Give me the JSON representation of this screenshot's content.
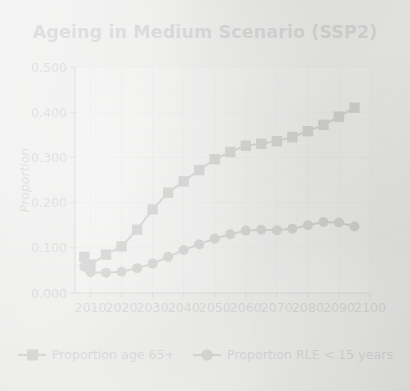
{
  "chart_data": {
    "type": "line",
    "title": "Ageing in Medium Scenario (SSP2)",
    "xlabel": "",
    "ylabel": "Proportion",
    "xlim": [
      2005,
      2100
    ],
    "ylim": [
      0.0,
      0.5
    ],
    "xticks": [
      2010,
      2020,
      2030,
      2040,
      2050,
      2060,
      2070,
      2080,
      2090,
      2100
    ],
    "xtick_labels": [
      "2010",
      "2020",
      "2030",
      "2040",
      "2050",
      "2060",
      "2070",
      "2080",
      "2090",
      "2100"
    ],
    "yticks": [
      0.0,
      0.1,
      0.2,
      0.3,
      0.4,
      0.5
    ],
    "ytick_labels": [
      "0.000",
      "0.100",
      "0.200",
      "0.300",
      "0.400",
      "0.500"
    ],
    "grid": true,
    "legend_position": "below",
    "line_color": "#000000",
    "series": [
      {
        "name": "Proportion age 65+",
        "marker": "square",
        "x": [
          2008,
          2010,
          2015,
          2020,
          2025,
          2030,
          2035,
          2040,
          2045,
          2050,
          2055,
          2060,
          2065,
          2070,
          2075,
          2080,
          2085,
          2090,
          2095
        ],
        "values": [
          0.08,
          0.063,
          0.085,
          0.103,
          0.14,
          0.185,
          0.222,
          0.247,
          0.272,
          0.296,
          0.312,
          0.326,
          0.33,
          0.336,
          0.345,
          0.358,
          0.372,
          0.39,
          0.41
        ]
      },
      {
        "name": "Proportion RLE < 15 years",
        "marker": "circle",
        "x": [
          2008,
          2010,
          2015,
          2020,
          2025,
          2030,
          2035,
          2040,
          2045,
          2050,
          2055,
          2060,
          2065,
          2070,
          2075,
          2080,
          2085,
          2090,
          2095
        ],
        "values": [
          0.058,
          0.046,
          0.045,
          0.047,
          0.055,
          0.065,
          0.08,
          0.095,
          0.108,
          0.12,
          0.13,
          0.138,
          0.14,
          0.139,
          0.142,
          0.15,
          0.157,
          0.156,
          0.147
        ]
      }
    ]
  },
  "legend": {
    "items": [
      {
        "label": "Proportion age 65+",
        "marker": "square"
      },
      {
        "label": "Proportion RLE < 15 years",
        "marker": "circle"
      }
    ]
  }
}
